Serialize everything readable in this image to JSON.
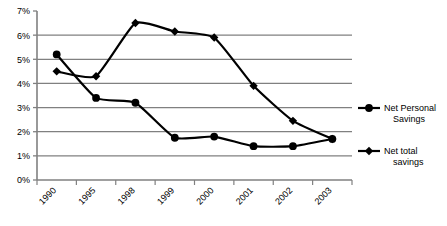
{
  "chart_data": {
    "type": "line",
    "title": "",
    "subtitle": "",
    "xlabel": "",
    "ylabel": "",
    "categories": [
      "1990",
      "1995",
      "1998",
      "1999",
      "2000",
      "2001",
      "2002",
      "2003"
    ],
    "series": [
      {
        "name": "Net Personal Savings",
        "marker": "circle",
        "color": "#000000",
        "values": [
          5.2,
          3.4,
          3.2,
          1.75,
          1.8,
          1.4,
          1.4,
          1.7
        ]
      },
      {
        "name": "Net total savings",
        "marker": "diamond",
        "color": "#000000",
        "values": [
          4.5,
          4.3,
          6.5,
          6.15,
          5.9,
          3.9,
          2.45,
          1.7
        ]
      }
    ],
    "ylim": [
      0,
      7
    ],
    "ytick_values": [
      0,
      1,
      2,
      3,
      4,
      5,
      6,
      7
    ],
    "ytick_labels": [
      "0%",
      "1%",
      "2%",
      "3%",
      "4%",
      "5%",
      "6%",
      "7%"
    ],
    "grid": true,
    "grid_axis": "y",
    "grid_color": "#808080",
    "axis_color": "#808080",
    "line_color": "#000000",
    "legend_position": "right",
    "xtick_rotation": -45,
    "smoothed": true
  },
  "legend": {
    "items": [
      {
        "label_line1": "Net Personal",
        "label_line2": "Savings",
        "marker": "circle"
      },
      {
        "label_line1": "Net total",
        "label_line2": "savings",
        "marker": "diamond"
      }
    ]
  },
  "yaxis": {
    "labels": [
      "7%",
      "6%",
      "5%",
      "4%",
      "3%",
      "2%",
      "1%",
      "0%"
    ]
  },
  "xaxis": {
    "labels": [
      "1990",
      "1995",
      "1998",
      "1999",
      "2000",
      "2001",
      "2002",
      "2003"
    ]
  }
}
